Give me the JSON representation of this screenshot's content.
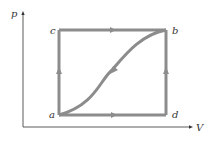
{
  "diagram": {
    "type": "pV-diagram",
    "axes": {
      "y_label": "p",
      "x_label": "V"
    },
    "points": [
      {
        "id": "a",
        "label": "a"
      },
      {
        "id": "b",
        "label": "b"
      },
      {
        "id": "c",
        "label": "c"
      },
      {
        "id": "d",
        "label": "d"
      }
    ],
    "paths": [
      {
        "name": "a-c-b",
        "description": "a up to c, then right to b"
      },
      {
        "name": "a-d-b",
        "description": "a right to d, then up to b"
      },
      {
        "name": "b-a curve",
        "description": "S-shaped curve from b back to a"
      }
    ],
    "colors": {
      "path": "#8c8c8c",
      "axis": "#333333",
      "background": "#ffffff"
    }
  }
}
